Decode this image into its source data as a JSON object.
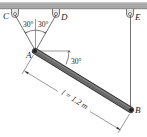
{
  "diagram": {
    "type": "statics-rod-suspended-by-cables",
    "points": {
      "C": {
        "label": "C"
      },
      "D": {
        "label": "D"
      },
      "E": {
        "label": "E"
      },
      "A": {
        "label": "A"
      },
      "B": {
        "label": "B"
      }
    },
    "angles": {
      "left_cable_angle": "30°",
      "right_cable_angle": "30°",
      "rod_angle": "30°"
    },
    "dimension": {
      "label": "l = 1.2 m"
    },
    "colors": {
      "ceiling": "#a9a9a9",
      "rod": "#5a5a5a",
      "cable": "#333333",
      "text": "#222222"
    }
  }
}
